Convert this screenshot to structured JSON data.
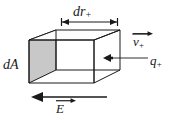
{
  "figure": {
    "name": "charge-flux-through-area-element",
    "background_color": "#ffffff",
    "line_color": "#1a1a1a",
    "face_fill_color": "#c8c8c8",
    "face_fill_color_top": "#d8d8d8",
    "labels": {
      "length_dimension": "dr",
      "length_dimension_subscript": "+",
      "area_face": "dA",
      "velocity_vector": "v",
      "velocity_vector_subscript": "+",
      "charge": "q",
      "charge_subscript": "+",
      "field_vector": "E"
    },
    "annotations": {
      "dimension_arrow_style": "double-headed-with-end-ticks",
      "velocity_arrow_direction": "right",
      "field_arrow_direction": "left",
      "charge_marker_direction": "left"
    }
  }
}
